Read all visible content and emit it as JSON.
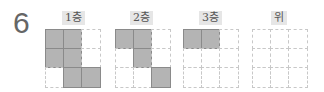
{
  "question_number": "6",
  "views": [
    {
      "label": "1층",
      "cells": [
        [
          1,
          1,
          0
        ],
        [
          1,
          1,
          0
        ],
        [
          0,
          1,
          1
        ]
      ]
    },
    {
      "label": "2층",
      "cells": [
        [
          1,
          1,
          0
        ],
        [
          0,
          1,
          0
        ],
        [
          0,
          0,
          1
        ]
      ]
    },
    {
      "label": "3층",
      "cells": [
        [
          1,
          1,
          0
        ],
        [
          0,
          0,
          0
        ],
        [
          0,
          0,
          0
        ]
      ]
    },
    {
      "label": "위",
      "cells": [
        [
          0,
          0,
          0
        ],
        [
          0,
          0,
          0
        ],
        [
          0,
          0,
          0
        ]
      ]
    }
  ],
  "colors": {
    "filled": "#b4b4b4",
    "filled_border": "#8a8a8a",
    "grid_line": "#c8c8c8",
    "label_bg": "#e6e6e6"
  }
}
